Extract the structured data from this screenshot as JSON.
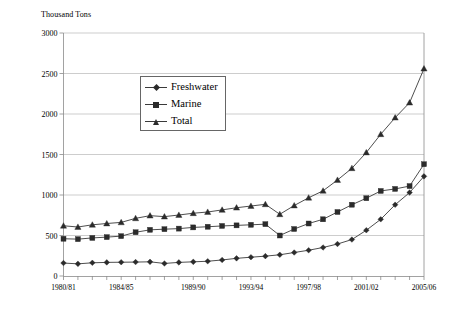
{
  "chart_data": {
    "type": "line",
    "title": "",
    "ylabel": "Thousand Tons",
    "xlabel": "",
    "ylim": [
      0,
      3000
    ],
    "yticks": [
      0,
      500,
      1000,
      1500,
      2000,
      2500,
      3000
    ],
    "grid": true,
    "legend_position": "upper-center-left",
    "x": [
      "1980/81",
      "1981/82",
      "1982/83",
      "1983/84",
      "1984/85",
      "1985/86",
      "1986/87",
      "1987/88",
      "1988/89",
      "1989/90",
      "1990/91",
      "1991/92",
      "1992/93",
      "1993/94",
      "1994/95",
      "1995/96",
      "1996/97",
      "1997/98",
      "1998/99",
      "1999/00",
      "2000/01",
      "2001/02",
      "2002/03",
      "2003/04",
      "2004/05",
      "2005/06"
    ],
    "xtick_labels": [
      "1980/81",
      "1984/85",
      "1989/90",
      "1993/94",
      "1997/98",
      "2001/02",
      "2005/06"
    ],
    "xtick_indices": [
      0,
      4,
      9,
      13,
      17,
      21,
      25
    ],
    "series": [
      {
        "name": "Freshwater",
        "marker": "diamond",
        "values": [
          160,
          150,
          163,
          168,
          170,
          172,
          175,
          155,
          168,
          175,
          182,
          198,
          218,
          232,
          245,
          262,
          290,
          318,
          352,
          395,
          450,
          565,
          700,
          880,
          1030,
          1230
        ]
      },
      {
        "name": "Marine",
        "marker": "square",
        "values": [
          460,
          455,
          470,
          480,
          492,
          540,
          570,
          578,
          585,
          600,
          608,
          618,
          625,
          632,
          640,
          500,
          580,
          648,
          700,
          790,
          880,
          960,
          1050,
          1075,
          1110,
          1380
        ]
      },
      {
        "name": "Total",
        "marker": "triangle",
        "values": [
          620,
          605,
          632,
          648,
          662,
          712,
          745,
          733,
          753,
          775,
          790,
          816,
          843,
          864,
          885,
          762,
          870,
          966,
          1052,
          1185,
          1330,
          1525,
          1750,
          1955,
          2140,
          2560
        ]
      }
    ]
  },
  "legend": {
    "items": [
      {
        "label": "Freshwater"
      },
      {
        "label": "Marine"
      },
      {
        "label": "Total"
      }
    ]
  },
  "colors": {
    "line": "#3a3a3a",
    "marker": "#2b2b2b",
    "grid": "#b8b8b8",
    "axis": "#8a8a8a"
  }
}
